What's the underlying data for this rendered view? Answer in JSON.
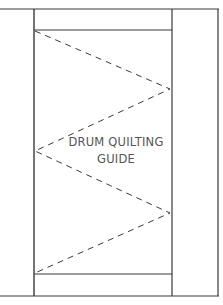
{
  "diagram": {
    "title_line1": "DRUM QUILTING",
    "title_line2": "GUIDE",
    "colors": {
      "line": "#3a3a3a",
      "text": "#555555",
      "background": "#ffffff"
    }
  }
}
